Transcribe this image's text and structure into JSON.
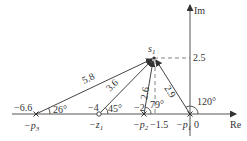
{
  "diagram": {
    "type": "s-plane pole-zero vector diagram",
    "colors": {
      "line": "#444444",
      "text": "#333333",
      "background": "#ffffff"
    },
    "axes": {
      "real_label": "Re",
      "imag_label": "Im",
      "origin_label": "0"
    },
    "test_point": {
      "label": "s",
      "subscript": "1",
      "imag_value_label": "2.5",
      "real_projection_label": "−1.5"
    },
    "points": [
      {
        "id": "p1",
        "symbol": "cross",
        "name_prefix": "−p",
        "subscript": "1",
        "value_label": ""
      },
      {
        "id": "p2",
        "symbol": "cross",
        "name_prefix": "−p",
        "subscript": "2",
        "value_label": "−2"
      },
      {
        "id": "z1",
        "symbol": "circle",
        "name_prefix": "−z",
        "subscript": "1",
        "value_label": "−4"
      },
      {
        "id": "p3",
        "symbol": "cross",
        "name_prefix": "−p",
        "subscript": "3",
        "value_label": "−6.6"
      }
    ],
    "vectors": [
      {
        "from": "p3",
        "length_label": "5.8",
        "angle_label": "26°"
      },
      {
        "from": "z1",
        "length_label": "3.6",
        "angle_label": "45°"
      },
      {
        "from": "p2",
        "length_label": "2.6",
        "angle_label": "79°"
      },
      {
        "from": "p1",
        "length_label": "2.9",
        "angle_label": "120°"
      }
    ]
  }
}
